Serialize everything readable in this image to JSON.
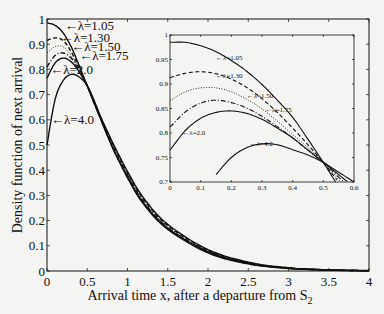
{
  "chart_data": [
    {
      "type": "line",
      "role": "main",
      "title": "",
      "xlabel": "Arrival time x, after a departure from S",
      "xlabel_subscript": "2",
      "ylabel": "Density function of next arrival",
      "xlim": [
        0,
        4
      ],
      "ylim": [
        0,
        1
      ],
      "xticks": [
        0,
        0.5,
        1,
        1.5,
        2,
        2.5,
        3,
        3.5,
        4
      ],
      "xtick_labels": [
        "0",
        "0.5",
        "1",
        "1.5",
        "2",
        "2.5",
        "3",
        "3.5",
        "4"
      ],
      "yticks": [
        0,
        0.1,
        0.2,
        0.3,
        0.4,
        0.5,
        0.6,
        0.7,
        0.8,
        0.9,
        1
      ],
      "ytick_labels": [
        "0",
        "0.1",
        "0.2",
        "0.3",
        "0.4",
        "0.5",
        "0.6",
        "0.7",
        "0.8",
        "0.9",
        "1"
      ],
      "grid": false,
      "x": [
        0,
        0.1,
        0.2,
        0.3,
        0.4,
        0.5,
        0.6,
        0.8,
        1.0,
        1.2,
        1.5,
        2.0,
        2.5,
        3.0,
        3.5,
        4.0
      ],
      "series": [
        {
          "name": "λ=1.05",
          "style": "solid",
          "values": [
            0.985,
            0.975,
            0.945,
            0.89,
            0.815,
            0.735,
            0.66,
            0.52,
            0.395,
            0.29,
            0.185,
            0.085,
            0.035,
            0.013,
            0.005,
            0.002
          ],
          "label": "←λ=1.05",
          "label_at": [
            0.22,
            0.975
          ]
        },
        {
          "name": "λ=1.30",
          "style": "dashed",
          "values": [
            0.915,
            0.925,
            0.915,
            0.87,
            0.805,
            0.735,
            0.655,
            0.515,
            0.39,
            0.285,
            0.18,
            0.082,
            0.033,
            0.012,
            0.004,
            0.001
          ],
          "label": "←λ=1.30",
          "label_at": [
            0.17,
            0.925
          ]
        },
        {
          "name": "λ=1.50",
          "style": "dotted",
          "values": [
            0.865,
            0.89,
            0.89,
            0.855,
            0.8,
            0.735,
            0.655,
            0.51,
            0.385,
            0.28,
            0.175,
            0.08,
            0.032,
            0.012,
            0.004,
            0.001
          ],
          "label": "←λ=1.50",
          "label_at": [
            0.3,
            0.89
          ]
        },
        {
          "name": "λ=1.75",
          "style": "dashdot",
          "values": [
            0.81,
            0.855,
            0.865,
            0.845,
            0.795,
            0.735,
            0.655,
            0.505,
            0.38,
            0.275,
            0.172,
            0.078,
            0.031,
            0.011,
            0.004,
            0.001
          ],
          "label": "←λ=1.75",
          "label_at": [
            0.4,
            0.855
          ]
        },
        {
          "name": "λ=2.0",
          "style": "solid",
          "values": [
            0.765,
            0.825,
            0.845,
            0.83,
            0.79,
            0.735,
            0.655,
            0.5,
            0.375,
            0.27,
            0.17,
            0.076,
            0.03,
            0.011,
            0.004,
            0.001
          ],
          "label": "←λ=2.0",
          "label_at": [
            0.04,
            0.8
          ]
        },
        {
          "name": "λ=4.0",
          "style": "solid",
          "values": [
            0.5,
            0.68,
            0.755,
            0.78,
            0.77,
            0.735,
            0.665,
            0.5,
            0.37,
            0.265,
            0.165,
            0.072,
            0.028,
            0.01,
            0.003,
            0.001
          ],
          "label": "←λ=4.0",
          "label_at": [
            0.05,
            0.6
          ]
        }
      ]
    },
    {
      "type": "line",
      "role": "inset",
      "title": "",
      "xlim": [
        0,
        0.6
      ],
      "ylim": [
        0.7,
        1
      ],
      "xticks": [
        0,
        0.1,
        0.2,
        0.3,
        0.4,
        0.5,
        0.6
      ],
      "xtick_labels": [
        "0",
        "0.1",
        "0.2",
        "0.3",
        "0.4",
        "0.5",
        "0.6"
      ],
      "yticks": [
        0.7,
        0.75,
        0.8,
        0.85,
        0.9,
        0.95,
        1
      ],
      "ytick_labels": [
        "0.7",
        "0.75",
        "0.8",
        "0.85",
        "0.9",
        "0.95",
        "1"
      ],
      "grid": false,
      "x": [
        0,
        0.05,
        0.1,
        0.15,
        0.2,
        0.25,
        0.3,
        0.35,
        0.4,
        0.45,
        0.5,
        0.55,
        0.6
      ],
      "series": [
        {
          "name": "λ=1.05",
          "style": "solid",
          "values": [
            0.985,
            0.985,
            0.978,
            0.966,
            0.948,
            0.926,
            0.899,
            0.867,
            0.832,
            0.787,
            0.74,
            0.69,
            0.64
          ],
          "label": "←λ=1.05",
          "label_at": [
            0.15,
            0.955
          ]
        },
        {
          "name": "λ=1.30",
          "style": "dashed",
          "values": [
            0.913,
            0.922,
            0.925,
            0.921,
            0.91,
            0.893,
            0.87,
            0.842,
            0.81,
            0.776,
            0.74,
            0.7,
            0.66
          ],
          "label": "←λ=1.30",
          "label_at": [
            0.15,
            0.918
          ]
        },
        {
          "name": "λ=1.50",
          "style": "dotted",
          "values": [
            0.866,
            0.884,
            0.892,
            0.892,
            0.884,
            0.869,
            0.849,
            0.824,
            0.797,
            0.77,
            0.74,
            0.705,
            0.67
          ],
          "label": "←λ=1.50",
          "label_at": [
            0.25,
            0.877
          ]
        },
        {
          "name": "λ=1.75",
          "style": "dashdot",
          "values": [
            0.812,
            0.843,
            0.861,
            0.867,
            0.862,
            0.851,
            0.834,
            0.813,
            0.79,
            0.765,
            0.74,
            0.71,
            0.68
          ],
          "label": "←λ=1.75",
          "label_at": [
            0.31,
            0.847
          ]
        },
        {
          "name": "λ=2.0",
          "style": "solid",
          "values": [
            0.765,
            0.805,
            0.83,
            0.842,
            0.845,
            0.84,
            0.828,
            0.81,
            0.79,
            0.765,
            0.74,
            0.715,
            0.69
          ],
          "label": "←λ=2.0",
          "label_at": [
            0.04,
            0.8
          ]
        },
        {
          "name": "λ=4.0",
          "style": "solid",
          "values": [
            null,
            null,
            null,
            0.715,
            0.75,
            0.77,
            0.778,
            0.776,
            0.766,
            0.755,
            0.74,
            0.72,
            0.7
          ],
          "label": "←λ=4.0",
          "label_at": [
            0.26,
            0.778
          ]
        }
      ]
    }
  ],
  "annotations": {
    "legend_position": "inline labels with arrows"
  }
}
